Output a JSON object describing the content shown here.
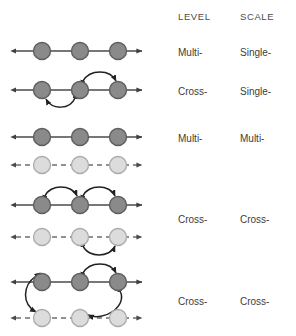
{
  "figure": {
    "type": "diagram",
    "colors": {
      "node_dark_fill": "#8a8a8a",
      "node_dark_stroke": "#5a5a5a",
      "node_light_fill": "#dcdcdc",
      "node_light_stroke": "#a8a8a8",
      "line_dark": "#4a4a4a",
      "line_light": "#6e6e6e",
      "arc": "#2b2b2b",
      "text": "#3c3c3c",
      "background": "#ffffff"
    },
    "node_positions_x": [
      42,
      80,
      118
    ],
    "line_span_x": [
      12,
      146
    ]
  },
  "headers": {
    "level": "LEVEL",
    "scale": "SCALE"
  },
  "rows": [
    {
      "id": "row-1",
      "level": "Multi-",
      "scale": "Single-",
      "lines": [
        {
          "style": "solid",
          "node_tone": "dark",
          "y": 51
        }
      ],
      "arcs": []
    },
    {
      "id": "row-2",
      "level": "Cross-",
      "scale": "Single-",
      "lines": [
        {
          "style": "solid",
          "node_tone": "dark",
          "y": 90
        }
      ],
      "arcs": [
        {
          "from": 1,
          "to": 0,
          "side": "below",
          "bidirectional": true
        },
        {
          "from": 1,
          "to": 2,
          "side": "above",
          "bidirectional": true
        }
      ]
    },
    {
      "id": "row-3",
      "level": "Multi-",
      "scale": "Multi-",
      "lines": [
        {
          "style": "solid",
          "node_tone": "dark",
          "y": 137
        },
        {
          "style": "dashed",
          "node_tone": "light",
          "y": 165
        }
      ],
      "arcs": []
    },
    {
      "id": "row-4",
      "level": "Cross-",
      "scale": "Cross-",
      "lines": [
        {
          "style": "solid",
          "node_tone": "dark",
          "y": 205
        },
        {
          "style": "dashed",
          "node_tone": "light",
          "y": 237
        }
      ],
      "arcs": [
        {
          "from": 0,
          "to": 1,
          "side": "above",
          "bidirectional": true
        },
        {
          "from": 1,
          "to": 2,
          "side": "above",
          "bidirectional": true
        },
        {
          "from": 1,
          "to": 2,
          "side": "below-lower",
          "bidirectional": true
        }
      ]
    },
    {
      "id": "row-5",
      "level": "Cross-",
      "scale": "Cross-",
      "lines": [
        {
          "style": "solid",
          "node_tone": "dark",
          "y": 282
        },
        {
          "style": "dashed",
          "node_tone": "light",
          "y": 318
        }
      ],
      "arcs": [
        {
          "from": "upper-0",
          "to": "lower-0",
          "side": "left-vertical",
          "bidirectional": true
        },
        {
          "from": "upper-1",
          "to": "upper-2",
          "side": "above",
          "bidirectional": true
        },
        {
          "from": "upper-2",
          "to": "lower-1",
          "side": "cross-diagonal",
          "bidirectional": true
        }
      ]
    }
  ],
  "label_rows": [
    {
      "level": "Multi-",
      "scale": "Single-",
      "y": 47
    },
    {
      "level": "Cross-",
      "scale": "Single-",
      "y": 86
    },
    {
      "level": "Multi-",
      "scale": "Multi-",
      "y": 133
    },
    {
      "level": "Cross-",
      "scale": "Cross-",
      "y": 214
    },
    {
      "level": "Cross-",
      "scale": "Cross-",
      "y": 296
    }
  ]
}
